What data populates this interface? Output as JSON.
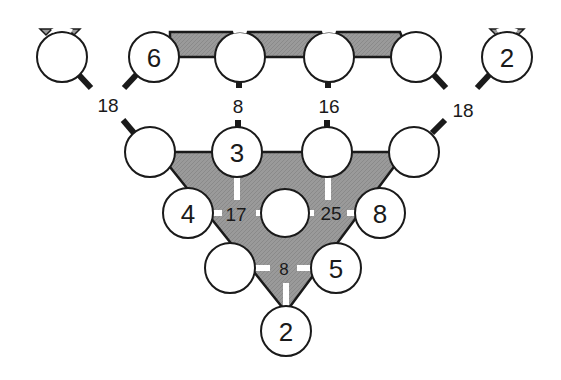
{
  "diagram": {
    "title": "",
    "colors": {
      "shaded_region": "#9a9a9a",
      "stroke": "#1a1a1a",
      "node_fill": "#ffffff"
    },
    "nodes": [
      {
        "id": "t1",
        "value": ""
      },
      {
        "id": "t2",
        "value": "6"
      },
      {
        "id": "t3",
        "value": ""
      },
      {
        "id": "t4",
        "value": ""
      },
      {
        "id": "t5",
        "value": ""
      },
      {
        "id": "t6",
        "value": "2"
      },
      {
        "id": "m1",
        "value": ""
      },
      {
        "id": "m2",
        "value": "3"
      },
      {
        "id": "m3",
        "value": ""
      },
      {
        "id": "m4",
        "value": ""
      },
      {
        "id": "c1",
        "value": "4"
      },
      {
        "id": "c2",
        "value": ""
      },
      {
        "id": "c3",
        "value": "8"
      },
      {
        "id": "l1",
        "value": ""
      },
      {
        "id": "l2",
        "value": "5"
      },
      {
        "id": "b1",
        "value": "2"
      }
    ],
    "sums": [
      {
        "id": "s-left-18",
        "value": "18",
        "connects": [
          "t1",
          "t2",
          "m1"
        ]
      },
      {
        "id": "s-8-top",
        "value": "8",
        "connects": [
          "t3",
          "m2"
        ]
      },
      {
        "id": "s-16",
        "value": "16",
        "connects": [
          "t4",
          "m3"
        ]
      },
      {
        "id": "s-right-18",
        "value": "18",
        "connects": [
          "t5",
          "t6",
          "m4"
        ]
      },
      {
        "id": "s-17",
        "value": "17",
        "connects": [
          "m2",
          "c1",
          "c2"
        ]
      },
      {
        "id": "s-25",
        "value": "25",
        "connects": [
          "m3",
          "c2",
          "c3"
        ]
      },
      {
        "id": "s-8-bottom",
        "value": "8",
        "connects": [
          "l1",
          "l2",
          "b1"
        ]
      }
    ]
  }
}
